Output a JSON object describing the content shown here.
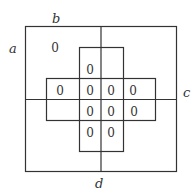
{
  "diagram": {
    "type": "venn-karnaugh-style region diagram",
    "labels": {
      "a": "a",
      "b": "b",
      "c": "c",
      "d": "d"
    },
    "zeros": [
      "0",
      "0",
      "0",
      "0",
      "0",
      "0",
      "0",
      "0",
      "0",
      "0",
      "0"
    ],
    "line_color": "#333333"
  }
}
